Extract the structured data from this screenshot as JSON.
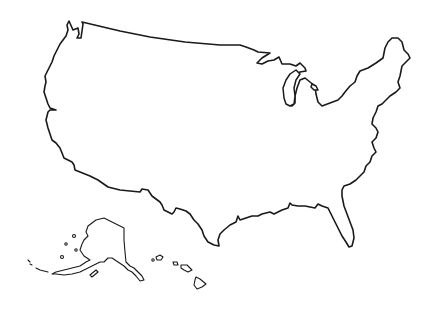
{
  "map": {
    "type": "outline-map",
    "subject": "United States",
    "background_color": "#ffffff",
    "stroke_color": "#1a1a1a",
    "regions": [
      {
        "name": "contiguous-us",
        "label": ""
      },
      {
        "name": "alaska",
        "label": ""
      },
      {
        "name": "hawaii",
        "label": ""
      }
    ],
    "labels_visible": false
  }
}
